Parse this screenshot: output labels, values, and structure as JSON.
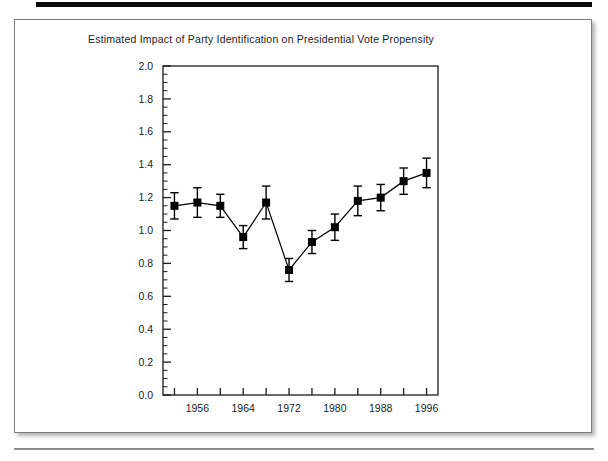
{
  "page": {
    "background_color": "#ffffff",
    "rule_color": "#0b0b0b",
    "card_border_color": "#7c7c7c"
  },
  "figure": {
    "title": "Estimated Impact of Party Identification on Presidential Vote Propensity"
  },
  "chart_data": {
    "type": "line",
    "title": "Estimated Impact of Party Identification on Presidential Vote Propensity",
    "xlabel": "",
    "ylabel": "",
    "xlim": [
      1950,
      1998
    ],
    "ylim": [
      0.0,
      2.0
    ],
    "grid": false,
    "legend": null,
    "marker": "filled-square",
    "errorbars": true,
    "line_color": "#000000",
    "marker_color": "#000000",
    "x": [
      1952,
      1956,
      1960,
      1964,
      1968,
      1972,
      1976,
      1980,
      1984,
      1988,
      1992,
      1996
    ],
    "values": [
      1.15,
      1.17,
      1.15,
      0.96,
      1.17,
      0.76,
      0.93,
      1.02,
      1.18,
      1.2,
      1.3,
      1.35
    ],
    "err_low": [
      0.08,
      0.09,
      0.07,
      0.07,
      0.1,
      0.07,
      0.07,
      0.08,
      0.09,
      0.08,
      0.08,
      0.09
    ],
    "err_high": [
      0.08,
      0.09,
      0.07,
      0.07,
      0.1,
      0.07,
      0.07,
      0.08,
      0.09,
      0.08,
      0.08,
      0.09
    ],
    "y_ticks": [
      0.0,
      0.2,
      0.4,
      0.6,
      0.8,
      1.0,
      1.2,
      1.4,
      1.6,
      1.8,
      2.0
    ],
    "y_tick_labels": [
      "0.0",
      "0.2",
      "0.4",
      "0.6",
      "0.8",
      "1.0",
      "1.2",
      "1.4",
      "1.6",
      "1.8",
      "2.0"
    ],
    "y_minor_step": 0.05,
    "x_ticks": [
      1952,
      1956,
      1960,
      1964,
      1968,
      1972,
      1976,
      1980,
      1984,
      1988,
      1992,
      1996
    ],
    "x_tick_labels": [
      "",
      "1956",
      "",
      "1964",
      "",
      "1972",
      "",
      "1980",
      "",
      "1988",
      "",
      "1996"
    ],
    "x_labeled_ticks": [
      1956,
      1964,
      1972,
      1980,
      1988,
      1996
    ]
  }
}
